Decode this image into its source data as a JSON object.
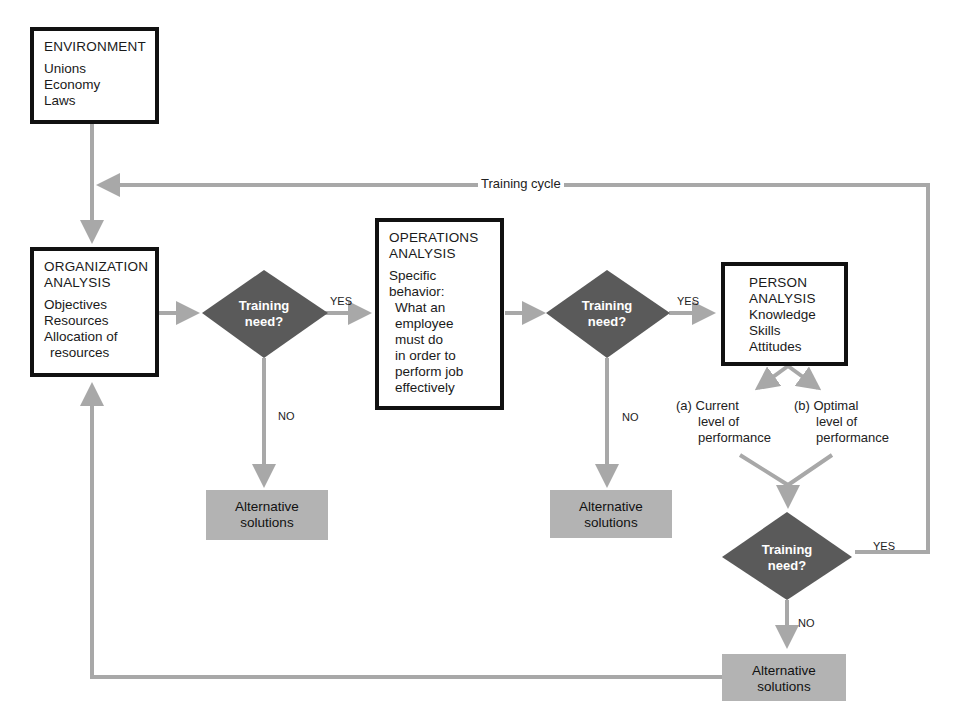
{
  "diagram": {
    "colors": {
      "connector": "#a8a8a8",
      "decision_fill": "#5a5a5a",
      "alt_fill": "#b3b3b3",
      "box_border": "#111111"
    },
    "environment": {
      "title": "ENVIRONMENT",
      "items": [
        "Unions",
        "Economy",
        "Laws"
      ]
    },
    "training_cycle_label": "Training cycle",
    "organization": {
      "title1": "ORGANIZATION",
      "title2": "ANALYSIS",
      "items": [
        "Objectives",
        "Resources",
        "Allocation of",
        "resources"
      ]
    },
    "operations": {
      "title1": "OPERATIONS",
      "title2": "ANALYSIS",
      "items": [
        "Specific",
        "behavior:",
        "What an",
        "employee",
        "must do",
        "in order to",
        "perform job",
        "effectively"
      ]
    },
    "person": {
      "title1": "PERSON",
      "title2": "ANALYSIS",
      "items": [
        "Knowledge",
        "Skills",
        "Attitudes"
      ]
    },
    "decisions": [
      {
        "line1": "Training",
        "line2": "need?",
        "yes": "YES",
        "no": "NO"
      },
      {
        "line1": "Training",
        "line2": "need?",
        "yes": "YES",
        "no": "NO"
      },
      {
        "line1": "Training",
        "line2": "need?",
        "yes": "YES",
        "no": "NO"
      }
    ],
    "alternatives": [
      {
        "line1": "Alternative",
        "line2": "solutions"
      },
      {
        "line1": "Alternative",
        "line2": "solutions"
      },
      {
        "line1": "Alternative",
        "line2": "solutions"
      }
    ],
    "current_performance": {
      "lines": [
        "(a) Current",
        "level of",
        "performance"
      ]
    },
    "optimal_performance": {
      "lines": [
        "(b) Optimal",
        "level of",
        "performance"
      ]
    }
  }
}
